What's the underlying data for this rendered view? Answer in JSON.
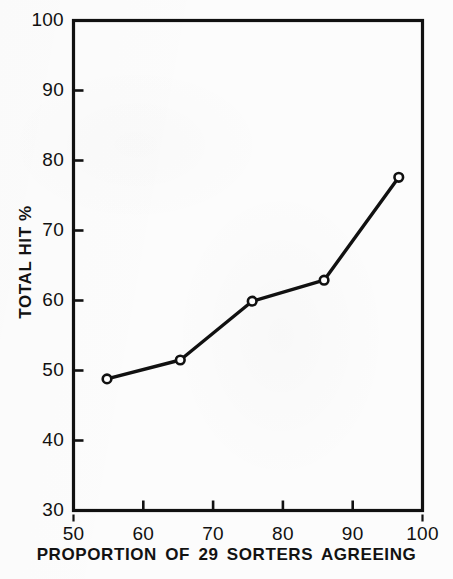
{
  "chart_data": {
    "type": "line",
    "title": "",
    "xlabel": "PROPORTION OF 29 SORTERS AGREEING",
    "ylabel": "TOTAL HIT %",
    "xlim": [
      50,
      100
    ],
    "ylim": [
      30,
      100
    ],
    "xticks": [
      50,
      60,
      70,
      80,
      90,
      100
    ],
    "yticks": [
      30,
      40,
      50,
      60,
      70,
      80,
      90,
      100
    ],
    "xtick_labels": [
      "50",
      "60",
      "70",
      "80",
      "90",
      "100"
    ],
    "ytick_labels": [
      "30",
      "40",
      "50",
      "60",
      "70",
      "80",
      "90",
      "100"
    ],
    "grid": false,
    "legend": null,
    "series": [
      {
        "name": "Total hit %",
        "marker": "open-circle",
        "line_color": "#111111",
        "marker_fill": "#ffffff",
        "points": [
          {
            "x": 54.8,
            "y": 48.8
          },
          {
            "x": 65.3,
            "y": 51.5
          },
          {
            "x": 75.6,
            "y": 59.9
          },
          {
            "x": 85.9,
            "y": 62.9
          },
          {
            "x": 96.6,
            "y": 77.6
          }
        ]
      }
    ]
  },
  "figure": {
    "frame_color": "#111111",
    "background_color": "#fcfcfc",
    "tick_direction": "in",
    "right_axis_ticks": false,
    "top_axis_ticks": false
  }
}
